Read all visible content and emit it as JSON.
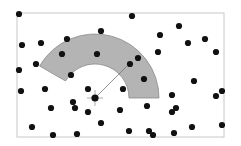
{
  "diagram": {
    "type": "spatial point pattern with annular sector neighborhood",
    "bounding_box": {
      "x": 17,
      "y": 13,
      "width": 207,
      "height": 124,
      "stroke": "#c8c8c8"
    },
    "focal_point": {
      "x": 95,
      "y": 98,
      "radius": 3.6,
      "crosshair_len": 8
    },
    "annulus_sector": {
      "cx": 95,
      "cy": 98,
      "inner_radius": 34,
      "outer_radius": 64,
      "start_angle_deg": 0,
      "end_angle_deg": 150,
      "fill": "#b4b4b4",
      "stroke": "#8c8c8c"
    },
    "radius_line": {
      "x1": 95,
      "y1": 98,
      "x2": 129,
      "y2": 64,
      "color": "#777777"
    },
    "point_color": "#111111",
    "point_radius": 3.1,
    "points": [
      [
        19,
        14
      ],
      [
        132,
        16
      ],
      [
        101,
        31
      ],
      [
        179,
        26
      ],
      [
        22,
        45
      ],
      [
        41,
        43
      ],
      [
        67,
        39
      ],
      [
        160,
        35
      ],
      [
        188,
        43
      ],
      [
        205,
        39
      ],
      [
        62,
        54
      ],
      [
        97,
        54
      ],
      [
        158,
        52
      ],
      [
        216,
        52
      ],
      [
        36,
        64
      ],
      [
        19,
        70
      ],
      [
        130,
        64
      ],
      [
        138,
        58
      ],
      [
        71,
        75
      ],
      [
        144,
        79
      ],
      [
        194,
        81
      ],
      [
        21,
        91
      ],
      [
        45,
        89
      ],
      [
        88,
        89
      ],
      [
        123,
        89
      ],
      [
        172,
        95
      ],
      [
        216,
        96
      ],
      [
        222,
        91
      ],
      [
        73,
        102
      ],
      [
        51,
        108
      ],
      [
        75,
        108
      ],
      [
        147,
        106
      ],
      [
        88,
        112
      ],
      [
        120,
        110
      ],
      [
        176,
        108
      ],
      [
        172,
        112
      ],
      [
        101,
        123
      ],
      [
        32,
        127
      ],
      [
        129,
        131
      ],
      [
        149,
        131
      ],
      [
        192,
        127
      ],
      [
        222,
        125
      ],
      [
        53,
        135
      ],
      [
        77,
        134
      ],
      [
        153,
        135
      ],
      [
        174,
        133
      ]
    ]
  }
}
